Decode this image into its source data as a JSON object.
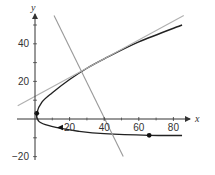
{
  "chart_data": {
    "type": "line",
    "title": "",
    "xlabel": "x",
    "ylabel": "y",
    "xlim": [
      -10,
      90
    ],
    "ylim": [
      -20,
      60
    ],
    "grid": false,
    "x_ticks": [
      20,
      40,
      60,
      80
    ],
    "y_ticks": [
      -20,
      20,
      40
    ],
    "x_tick_labels": [
      "20",
      "40",
      "60",
      "80"
    ],
    "y_tick_labels": [
      "−20",
      "20",
      "40"
    ],
    "series": [
      {
        "name": "parametric curve",
        "style": "solid dark",
        "color": "#222222",
        "points": [
          [
            85,
            50
          ],
          [
            60,
            41
          ],
          [
            40,
            32
          ],
          [
            30,
            27
          ],
          [
            20,
            21
          ],
          [
            10,
            14
          ],
          [
            4,
            9
          ],
          [
            1,
            3
          ],
          [
            2,
            -1
          ],
          [
            6,
            -3
          ],
          [
            15,
            -5
          ],
          [
            25,
            -6.5
          ],
          [
            40,
            -7.8
          ],
          [
            66,
            -8.7
          ],
          [
            85,
            -8.8
          ]
        ]
      },
      {
        "name": "tangent line",
        "style": "solid light gray",
        "color": "#b0b0b0",
        "points": [
          [
            -10,
            7
          ],
          [
            86,
            55
          ]
        ]
      },
      {
        "name": "normal line",
        "style": "solid gray",
        "color": "#999999",
        "points": [
          [
            11,
            55
          ],
          [
            51,
            -20
          ]
        ]
      }
    ],
    "annotations": [
      {
        "type": "dot",
        "x": 1,
        "y": 3
      },
      {
        "type": "arrow",
        "x": 15,
        "y": -4.5,
        "direction": "left"
      },
      {
        "type": "dot",
        "x": 66,
        "y": -8.7
      }
    ]
  }
}
